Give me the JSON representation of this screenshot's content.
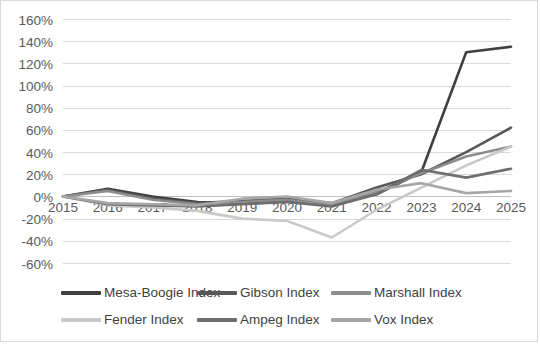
{
  "chart_data": {
    "type": "line",
    "title": "",
    "xlabel": "",
    "ylabel": "",
    "grid": true,
    "legend_position": "bottom",
    "x": [
      "2015",
      "2016",
      "2017",
      "2018",
      "2019",
      "2020",
      "2021",
      "2022",
      "2023",
      "2024",
      "2025"
    ],
    "ylim": [
      -60,
      160
    ],
    "ytick_step": 20,
    "ytick_labels": [
      "160%",
      "140%",
      "120%",
      "100%",
      "80%",
      "60%",
      "40%",
      "20%",
      "0%",
      "-20%",
      "-40%",
      "-60%"
    ],
    "ytick_values": [
      160,
      140,
      120,
      100,
      80,
      60,
      40,
      20,
      0,
      -20,
      -40,
      -60
    ],
    "series": [
      {
        "name": "Mesa-Boogie Index",
        "color": "#404040",
        "values": [
          0,
          7,
          0,
          -5,
          -6,
          -4,
          -7,
          2,
          22,
          130,
          135
        ]
      },
      {
        "name": "Gibson Index",
        "color": "#585858",
        "values": [
          0,
          6,
          -2,
          -6,
          -4,
          -2,
          -6,
          8,
          20,
          40,
          62
        ]
      },
      {
        "name": "Marshall Index",
        "color": "#8c8c8c",
        "values": [
          0,
          5,
          -3,
          -7,
          -5,
          -3,
          -8,
          4,
          21,
          36,
          45
        ]
      },
      {
        "name": "Fender Index",
        "color": "#c9c9c9",
        "values": [
          0,
          -8,
          -10,
          -13,
          -20,
          -22,
          -37,
          -12,
          8,
          28,
          45
        ]
      },
      {
        "name": "Ampeg Index",
        "color": "#6e6e6e",
        "values": [
          0,
          -7,
          -8,
          -9,
          -7,
          -5,
          -9,
          2,
          24,
          17,
          25
        ]
      },
      {
        "name": "Vox Index",
        "color": "#a6a6a6",
        "values": [
          0,
          -6,
          -7,
          -8,
          -2,
          0,
          -6,
          6,
          12,
          3,
          5
        ]
      }
    ]
  },
  "legend": {
    "rows": [
      [
        "Mesa-Boogie Index",
        "Gibson Index",
        "Marshall Index"
      ],
      [
        "Fender Index",
        "Ampeg Index",
        "Vox Index"
      ]
    ]
  }
}
